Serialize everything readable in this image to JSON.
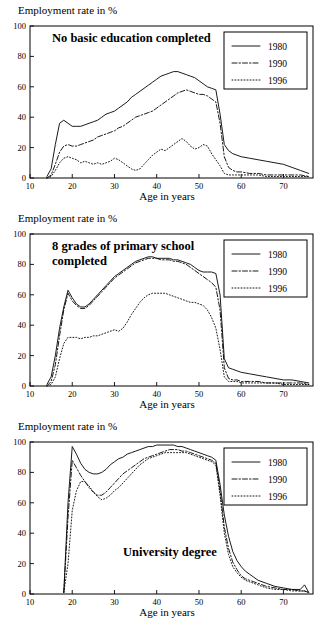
{
  "figure": {
    "panel_count": 3,
    "shared_ylabel": "Employment rate in %",
    "shared_xlabel": "Age in years",
    "legend_labels": [
      "1980",
      "1990",
      "1996"
    ],
    "line_color": "#000000"
  },
  "chart_data": [
    {
      "type": "line",
      "title": "No basic education completed",
      "xlabel": "Age in years",
      "ylabel": "Employment rate in %",
      "xlim": [
        10,
        77
      ],
      "ylim": [
        0,
        100
      ],
      "xticks": [
        10,
        20,
        30,
        40,
        50,
        60,
        70
      ],
      "yticks": [
        0,
        20,
        40,
        60,
        80,
        100
      ],
      "grid": false,
      "legend_position": "top-right",
      "x": [
        14,
        15,
        16,
        17,
        18,
        19,
        20,
        21,
        22,
        23,
        24,
        25,
        26,
        27,
        28,
        29,
        30,
        31,
        32,
        33,
        34,
        35,
        36,
        37,
        38,
        39,
        40,
        41,
        42,
        43,
        44,
        45,
        46,
        47,
        48,
        49,
        50,
        51,
        52,
        53,
        54,
        55,
        56,
        57,
        58,
        59,
        60,
        62,
        64,
        66,
        68,
        70,
        72,
        74,
        76
      ],
      "series": [
        {
          "name": "1980",
          "style": "solid",
          "values": [
            1,
            6,
            22,
            36,
            38,
            36,
            34,
            34,
            34,
            35,
            36,
            37,
            38,
            40,
            42,
            43,
            44,
            46,
            48,
            50,
            53,
            55,
            57,
            59,
            61,
            63,
            65,
            67,
            68,
            69,
            70,
            70,
            69,
            68,
            67,
            66,
            64,
            62,
            60,
            59,
            58,
            42,
            22,
            18,
            16,
            15,
            14,
            13,
            12,
            11,
            10,
            9,
            7,
            5,
            3
          ]
        },
        {
          "name": "1990",
          "style": "dashdot",
          "values": [
            0,
            2,
            9,
            17,
            21,
            22,
            21,
            21,
            22,
            23,
            24,
            25,
            27,
            28,
            29,
            30,
            31,
            33,
            34,
            36,
            38,
            40,
            41,
            42,
            43,
            44,
            46,
            48,
            50,
            52,
            54,
            56,
            57,
            58,
            57,
            56,
            55,
            55,
            54,
            52,
            50,
            36,
            14,
            7,
            5,
            4,
            4,
            3,
            3,
            2,
            2,
            2,
            2,
            2,
            1
          ]
        },
        {
          "name": "1996",
          "style": "dotted",
          "values": [
            0,
            1,
            5,
            10,
            13,
            14,
            13,
            12,
            10,
            11,
            10,
            9,
            10,
            9,
            10,
            11,
            13,
            12,
            10,
            8,
            6,
            5,
            6,
            9,
            12,
            15,
            17,
            19,
            18,
            20,
            22,
            24,
            26,
            24,
            21,
            19,
            20,
            22,
            21,
            16,
            12,
            8,
            3,
            2,
            2,
            2,
            2,
            2,
            2,
            1,
            1,
            1,
            1,
            1,
            1
          ]
        }
      ]
    },
    {
      "type": "line",
      "title": "8 grades of primary school completed",
      "xlabel": "Age in years",
      "ylabel": "Employment rate in %",
      "xlim": [
        10,
        77
      ],
      "ylim": [
        0,
        100
      ],
      "xticks": [
        10,
        20,
        30,
        40,
        50,
        60,
        70
      ],
      "yticks": [
        0,
        20,
        40,
        60,
        80,
        100
      ],
      "grid": false,
      "legend_position": "top-right",
      "x": [
        14,
        15,
        16,
        17,
        18,
        19,
        20,
        21,
        22,
        23,
        24,
        25,
        26,
        27,
        28,
        29,
        30,
        31,
        32,
        33,
        34,
        35,
        36,
        37,
        38,
        39,
        40,
        41,
        42,
        43,
        44,
        45,
        46,
        47,
        48,
        49,
        50,
        51,
        52,
        53,
        54,
        55,
        56,
        57,
        58,
        59,
        60,
        62,
        64,
        66,
        68,
        70,
        72,
        74,
        76
      ],
      "series": [
        {
          "name": "1980",
          "style": "solid",
          "values": [
            1,
            6,
            20,
            38,
            52,
            63,
            58,
            54,
            52,
            52,
            54,
            57,
            60,
            63,
            66,
            69,
            72,
            74,
            76,
            78,
            80,
            82,
            83,
            84,
            85,
            85,
            84,
            84,
            84,
            84,
            83,
            83,
            82,
            81,
            80,
            78,
            76,
            75,
            75,
            75,
            74,
            60,
            18,
            12,
            11,
            10,
            9,
            8,
            7,
            6,
            5,
            4,
            4,
            3,
            2
          ]
        },
        {
          "name": "1990",
          "style": "dashdot",
          "values": [
            0,
            3,
            14,
            33,
            50,
            61,
            56,
            53,
            51,
            51,
            53,
            56,
            59,
            62,
            65,
            68,
            71,
            73,
            75,
            77,
            79,
            81,
            82,
            83,
            84,
            84,
            84,
            83,
            83,
            83,
            82,
            82,
            81,
            80,
            78,
            76,
            74,
            72,
            70,
            68,
            65,
            50,
            12,
            5,
            4,
            4,
            3,
            3,
            3,
            2,
            2,
            2,
            2,
            2,
            1
          ]
        },
        {
          "name": "1996",
          "style": "dotted",
          "values": [
            0,
            1,
            6,
            18,
            28,
            32,
            32,
            32,
            31,
            32,
            32,
            33,
            33,
            34,
            35,
            36,
            37,
            36,
            38,
            42,
            47,
            51,
            55,
            58,
            60,
            61,
            61,
            61,
            61,
            60,
            59,
            58,
            57,
            56,
            55,
            55,
            54,
            53,
            50,
            45,
            38,
            24,
            6,
            3,
            3,
            3,
            2,
            2,
            2,
            2,
            2,
            1,
            1,
            1,
            1
          ]
        }
      ]
    },
    {
      "type": "line",
      "title": "University degree",
      "xlabel": "Age in years",
      "ylabel": "Employment rate in %",
      "xlim": [
        10,
        77
      ],
      "ylim": [
        0,
        100
      ],
      "xticks": [
        10,
        20,
        30,
        40,
        50,
        60,
        70
      ],
      "yticks": [
        0,
        20,
        40,
        60,
        80,
        100
      ],
      "grid": false,
      "legend_position": "top-right",
      "x": [
        18,
        19,
        20,
        21,
        22,
        23,
        24,
        25,
        26,
        27,
        28,
        29,
        30,
        31,
        32,
        33,
        34,
        35,
        36,
        37,
        38,
        39,
        40,
        41,
        42,
        43,
        44,
        45,
        46,
        47,
        48,
        49,
        50,
        51,
        52,
        53,
        54,
        55,
        56,
        57,
        58,
        59,
        60,
        61,
        62,
        63,
        64,
        66,
        68,
        70,
        72,
        74,
        75,
        76
      ],
      "series": [
        {
          "name": "1980",
          "style": "solid",
          "values": [
            1,
            60,
            97,
            92,
            86,
            82,
            80,
            79,
            79,
            80,
            82,
            85,
            87,
            89,
            90,
            92,
            93,
            94,
            95,
            96,
            97,
            97,
            98,
            98,
            98,
            98,
            98,
            97,
            97,
            96,
            95,
            94,
            93,
            92,
            91,
            90,
            88,
            72,
            52,
            38,
            28,
            22,
            18,
            15,
            13,
            11,
            9,
            7,
            5,
            4,
            3,
            3,
            6,
            1
          ]
        },
        {
          "name": "1990",
          "style": "dashdot",
          "values": [
            1,
            50,
            88,
            83,
            78,
            74,
            70,
            67,
            65,
            65,
            67,
            70,
            73,
            76,
            79,
            81,
            83,
            85,
            87,
            89,
            90,
            91,
            92,
            93,
            94,
            95,
            95,
            95,
            94,
            94,
            93,
            92,
            91,
            90,
            89,
            88,
            86,
            68,
            44,
            30,
            21,
            16,
            12,
            10,
            9,
            8,
            7,
            5,
            4,
            3,
            3,
            2,
            2,
            1
          ]
        },
        {
          "name": "1996",
          "style": "dotted",
          "values": [
            1,
            20,
            55,
            68,
            74,
            74,
            71,
            67,
            64,
            62,
            63,
            65,
            68,
            70,
            73,
            76,
            79,
            82,
            85,
            87,
            89,
            90,
            91,
            92,
            93,
            93,
            93,
            93,
            93,
            93,
            92,
            91,
            90,
            89,
            88,
            87,
            85,
            65,
            40,
            26,
            18,
            14,
            11,
            9,
            8,
            7,
            6,
            4,
            3,
            3,
            2,
            2,
            2,
            1
          ]
        }
      ]
    }
  ]
}
